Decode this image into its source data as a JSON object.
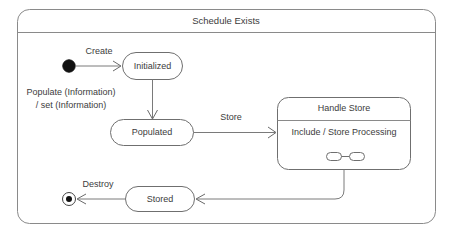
{
  "diagram": {
    "kind": "uml-state-machine-diagram",
    "frame": {
      "title": "Schedule Exists"
    },
    "nodes": [
      {
        "id": "initial",
        "type": "initial-state",
        "label": ""
      },
      {
        "id": "initialized",
        "type": "state",
        "label": "Initialized"
      },
      {
        "id": "populated",
        "type": "state",
        "label": "Populated"
      },
      {
        "id": "handle-store",
        "type": "composite-state",
        "title": "Handle Store",
        "body": "Include / Store Processing",
        "submachine_icon": "submachine-icon"
      },
      {
        "id": "stored",
        "type": "state",
        "label": "Stored"
      },
      {
        "id": "final",
        "type": "final-state",
        "label": ""
      }
    ],
    "transitions": [
      {
        "id": "create",
        "from": "initial",
        "to": "initialized",
        "label": "Create"
      },
      {
        "id": "populate",
        "from": "initialized",
        "to": "populated",
        "label_line1": "Populate (Information)",
        "label_line2": "/ set (Information)"
      },
      {
        "id": "store",
        "from": "populated",
        "to": "handle-store",
        "label": "Store"
      },
      {
        "id": "handle-store-to-stored",
        "from": "handle-store",
        "to": "stored",
        "label": ""
      },
      {
        "id": "destroy",
        "from": "stored",
        "to": "final",
        "label": "Destroy"
      }
    ]
  },
  "colors": {
    "background": "#ffffff",
    "frame_stroke": "#8a8a8a",
    "node_stroke": "#6f6f6f",
    "line_stroke": "#7a7a7a",
    "text": "#3c3c3c",
    "initial_fill": "#111111"
  }
}
